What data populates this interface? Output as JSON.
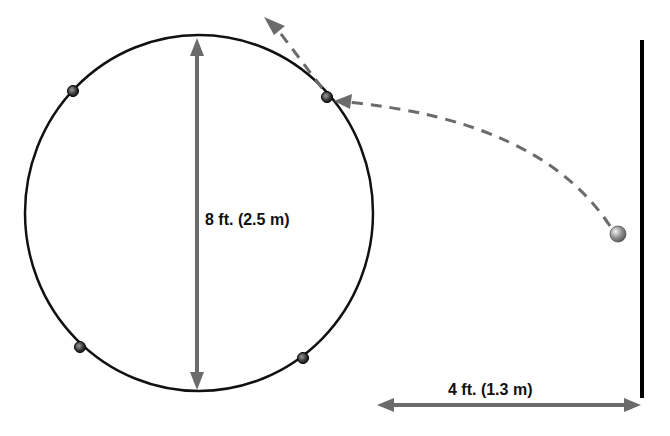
{
  "diagram": {
    "labels": {
      "diameter": "8 ft. (2.5 m)",
      "wall_distance": "4 ft. (1.3 m)"
    },
    "circle": {
      "cx": 199,
      "cy": 213,
      "rx": 174,
      "ry": 178,
      "stroke": "#111111"
    },
    "markers": [
      {
        "name": "upper-left",
        "x": 73,
        "y": 91
      },
      {
        "name": "upper-right",
        "x": 327,
        "y": 97
      },
      {
        "name": "lower-left",
        "x": 80,
        "y": 347
      },
      {
        "name": "lower-right",
        "x": 303,
        "y": 358
      }
    ],
    "ball": {
      "x": 618,
      "y": 234,
      "color": "#8a8a8a"
    },
    "wall": {
      "x": 642,
      "y1": 40,
      "y2": 398,
      "color": "#000000"
    },
    "colors": {
      "arrow": "#6b6b6b",
      "dashed_path": "#6b6b6b",
      "circle_line": "#111111",
      "text": "#111111"
    }
  }
}
